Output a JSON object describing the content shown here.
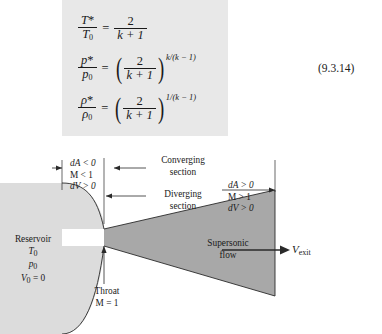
{
  "equation_block": {
    "background_color": "#e8e8e8",
    "equations": [
      {
        "id": "temperature-ratio",
        "lhs_num": "T*",
        "lhs_den": "T0",
        "lhs_den_base": "T",
        "lhs_den_sub": "0",
        "equals": "=",
        "rhs_num": "2",
        "rhs_den": "k + 1",
        "exponent": ""
      },
      {
        "id": "pressure-ratio",
        "lhs_num": "p*",
        "lhs_den": "p0",
        "lhs_den_base": "p",
        "lhs_den_sub": "0",
        "equals": "=",
        "rhs_num": "2",
        "rhs_den": "k + 1",
        "exponent": "k/(k − 1)"
      },
      {
        "id": "density-ratio",
        "lhs_num": "ρ*",
        "lhs_den": "ρ0",
        "lhs_den_base": "ρ",
        "lhs_den_sub": "0",
        "equals": "=",
        "rhs_num": "2",
        "rhs_den": "k + 1",
        "exponent": "1/(k − 1)"
      }
    ],
    "symbols": {
      "T_star": "T",
      "p_star": "p",
      "rho_star": "ρ",
      "star": "*",
      "sub_zero": "0",
      "two": "2",
      "k": "k",
      "plus_one": "+ 1"
    }
  },
  "equation_number": "(9.3.14)",
  "figure": {
    "converging": {
      "conditions": [
        "dA < 0",
        "M < 1",
        "dV > 0"
      ],
      "section_label_line1": "Converging",
      "section_label_line2": "section"
    },
    "diverging": {
      "conditions": [
        "dA > 0",
        "M > 1",
        "dV > 0"
      ],
      "section_label_line1": "Diverging",
      "section_label_line2": "section"
    },
    "reservoir": {
      "title": "Reservoir",
      "properties": [
        "T0",
        "p0",
        "V0 = 0"
      ],
      "t0_base": "T",
      "t0_sub": "0",
      "p0_base": "p",
      "p0_sub": "0",
      "v0_base": "V",
      "v0_sub": "0",
      "v0_value": "= 0",
      "fill_color": "#dcdcdc"
    },
    "throat": {
      "label": "Throat",
      "mach": "M = 1"
    },
    "supersonic": {
      "line1": "Supersonic",
      "line2": "flow",
      "fill_color": "#a8a8a8"
    },
    "exit": {
      "velocity_base": "V",
      "velocity_sub": "exit"
    }
  }
}
